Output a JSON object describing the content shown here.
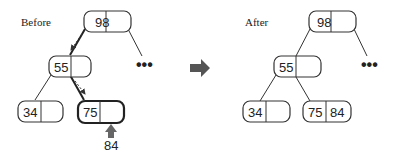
{
  "before": {
    "label": "Before",
    "root": {
      "keys": [
        "98",
        ""
      ]
    },
    "level1": {
      "keys": [
        "55",
        ""
      ]
    },
    "leaves": [
      {
        "keys": [
          "34",
          ""
        ]
      },
      {
        "keys": [
          "75",
          ""
        ],
        "highlighted": true
      }
    ],
    "ellipsis": "•••",
    "insert_value": "84",
    "insert_arrow_color": "#666666"
  },
  "transition_arrow": {
    "icon": "right-arrow-icon",
    "color": "#555555"
  },
  "after": {
    "label": "After",
    "root": {
      "keys": [
        "98",
        ""
      ]
    },
    "level1": {
      "keys": [
        "55",
        ""
      ]
    },
    "leaves": [
      {
        "keys": [
          "34",
          ""
        ]
      },
      {
        "keys": [
          "75",
          "84"
        ]
      }
    ],
    "ellipsis": "•••"
  }
}
